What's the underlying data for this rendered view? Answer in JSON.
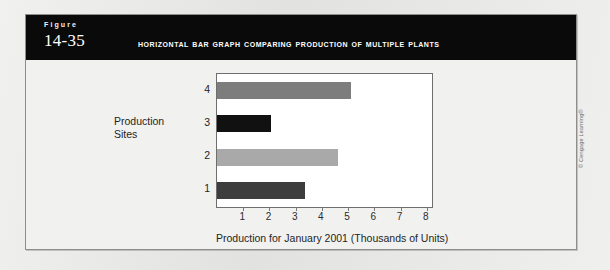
{
  "figure": {
    "label_word": "Figure",
    "number": "14-35",
    "title": "Horizontal Bar Graph Comparing Production of Multiple Plants"
  },
  "credit": "© Cengage Learning®",
  "colors": {
    "header_background": "#0a0a0a",
    "header_text": "#ffffff",
    "panel_background": "#f1f1ef",
    "plot_background": "#ffffff",
    "plot_border": "#6e6e6e",
    "page_background": "#e9e9e7"
  },
  "chart_data": {
    "type": "bar",
    "orientation": "horizontal",
    "title": "Horizontal Bar Graph Comparing Production of Multiple Plants",
    "xlabel": "Production for January 2001 (Thousands of Units)",
    "ylabel": "Production Sites",
    "categories": [
      "1",
      "2",
      "3",
      "4"
    ],
    "values": [
      3.35,
      4.6,
      2.05,
      5.1
    ],
    "bar_colors": [
      "#3d3d3d",
      "#a9a9a9",
      "#111111",
      "#7d7d7d"
    ],
    "xlim": [
      0,
      8.2
    ],
    "xticks": [
      1,
      2,
      3,
      4,
      5,
      6,
      7,
      8
    ],
    "xticklabels": [
      "1",
      "2",
      "3",
      "4",
      "5",
      "6",
      "7",
      "8"
    ],
    "grid": false,
    "legend": false
  }
}
